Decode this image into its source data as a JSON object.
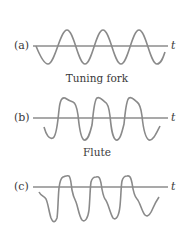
{
  "panels": [
    {
      "id": "a",
      "label": "(a)",
      "axis_label": "t",
      "caption": "Tuning fork",
      "waveform": "pure sine, 3 cycles"
    },
    {
      "id": "b",
      "label": "(b)",
      "axis_label": "t",
      "caption": "Flute",
      "waveform": "periodic with harmonics, 3 cycles"
    },
    {
      "id": "c",
      "label": "(c)",
      "axis_label": "t",
      "caption": "",
      "waveform": "complex periodic (richer harmonics), 3 cycles"
    }
  ],
  "colors": {
    "wave": "#8a8a8a",
    "axis": "#555555",
    "text": "#3a3a3a"
  }
}
